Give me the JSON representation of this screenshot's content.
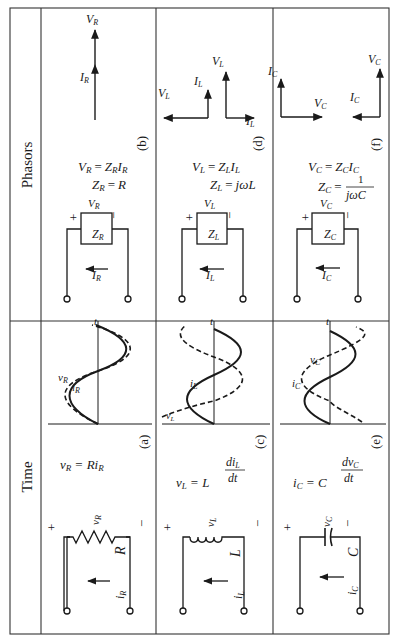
{
  "table": {
    "headers": {
      "time": "Time",
      "phasors": "Phasors"
    },
    "rows": [
      {
        "element": "resistor",
        "time": {
          "label": "(a)",
          "element_symbol": "R",
          "voltage_symbol": "v",
          "voltage_sub": "R",
          "current_symbol": "i",
          "current_sub": "R",
          "plus": "+",
          "minus": "−",
          "equation": "v_R = R i_R",
          "eq_lhs": "v",
          "eq_lhs_sub": "R",
          "eq_eq": "=",
          "eq_rhs": "Ri",
          "eq_rhs_sub": "R",
          "wave_labels": {
            "v": "v",
            "v_sub": "R",
            "i": "i",
            "i_sub": "R",
            "t": "t"
          }
        },
        "phasor": {
          "label": "(b)",
          "impedance": "Z",
          "impedance_sub": "R",
          "voltage": "V",
          "voltage_sub": "R",
          "current": "I",
          "current_sub": "R",
          "plus": "+",
          "minus": "−",
          "eq1": "V_R = Z_R I_R",
          "eq2": "Z_R = R",
          "eq1_parts": [
            "V",
            "R",
            "=",
            "Z",
            "R",
            "I",
            "R"
          ],
          "eq2_parts": [
            "Z",
            "R",
            "=",
            "R"
          ],
          "diagram_labels": {
            "I": "I",
            "I_sub": "R",
            "V": "V",
            "V_sub": "R"
          }
        }
      },
      {
        "element": "inductor",
        "time": {
          "label": "(c)",
          "element_symbol": "L",
          "voltage_symbol": "v",
          "voltage_sub": "L",
          "current_symbol": "i",
          "current_sub": "L",
          "plus": "+",
          "minus": "−",
          "equation": "v_L = L di_L/dt",
          "eq_lhs": "v",
          "eq_lhs_sub": "L",
          "eq_eq": "=",
          "eq_coef": "L",
          "eq_num": "di",
          "eq_num_sub": "L",
          "eq_den": "dt",
          "wave_labels": {
            "v": "v",
            "v_sub": "L",
            "i": "i",
            "i_sub": "L",
            "t": "t"
          }
        },
        "phasor": {
          "label": "(d)",
          "impedance": "Z",
          "impedance_sub": "L",
          "voltage": "V",
          "voltage_sub": "L",
          "current": "I",
          "current_sub": "L",
          "plus": "+",
          "minus": "−",
          "eq1": "V_L = Z_L I_L",
          "eq2": "Z_L = jωL",
          "eq2_rhs": "jωL",
          "diagram_labels": {
            "I": "I",
            "I_sub": "L",
            "V": "V",
            "V_sub": "L"
          }
        }
      },
      {
        "element": "capacitor",
        "time": {
          "label": "(e)",
          "element_symbol": "C",
          "voltage_symbol": "v",
          "voltage_sub": "C",
          "current_symbol": "i",
          "current_sub": "C",
          "plus": "+",
          "minus": "−",
          "equation": "i_C = C dv_C/dt",
          "eq_lhs": "i",
          "eq_lhs_sub": "C",
          "eq_eq": "=",
          "eq_coef": "C",
          "eq_num": "dv",
          "eq_num_sub": "C",
          "eq_den": "dt",
          "wave_labels": {
            "v": "v",
            "v_sub": "C",
            "i": "i",
            "i_sub": "C",
            "t": "t"
          }
        },
        "phasor": {
          "label": "(f)",
          "impedance": "Z",
          "impedance_sub": "C",
          "voltage": "V",
          "voltage_sub": "C",
          "current": "I",
          "current_sub": "C",
          "plus": "+",
          "minus": "−",
          "eq1": "V_C = Z_C I_C",
          "eq2": "Z_C = 1/(jωC)",
          "eq2_num": "1",
          "eq2_den": "jωC",
          "diagram_labels": {
            "I": "I",
            "I_sub": "C",
            "V": "V",
            "V_sub": "C"
          }
        }
      }
    ]
  },
  "colors": {
    "ink": "#1a1a1a",
    "border": "#333333",
    "paper": "#ffffff"
  }
}
